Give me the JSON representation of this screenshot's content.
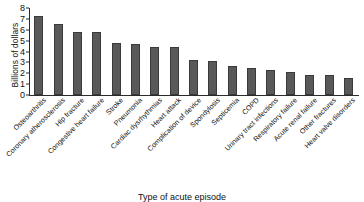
{
  "chart_data": {
    "type": "bar",
    "title": "",
    "xlabel": "Type of acute episode",
    "ylabel": "Billions of dollars",
    "ylim": [
      0,
      8
    ],
    "yticks": [
      0,
      1,
      2,
      3,
      4,
      5,
      6,
      7,
      8
    ],
    "grid": false,
    "legend": null,
    "bar_color": "#595959",
    "bar_edge_color": "#3a3a3a",
    "categories": [
      "Osteoarthritis",
      "Coronary atherosclerosis",
      "Hip fracture",
      "Congestive heart failure",
      "Stroke",
      "Pneumonia",
      "Cardiac dysrhythmias",
      "Heart attack",
      "Complication of device",
      "Spondylosis",
      "Septicemia",
      "COPD",
      "Urinary tract infections",
      "Respiratory failure",
      "Acute renal failure",
      "Other fractures",
      "Heart valve disorders"
    ],
    "values": [
      7.3,
      6.5,
      5.8,
      5.8,
      4.8,
      4.7,
      4.4,
      4.4,
      3.2,
      3.1,
      2.7,
      2.5,
      2.3,
      2.1,
      1.8,
      1.8,
      1.6
    ]
  }
}
